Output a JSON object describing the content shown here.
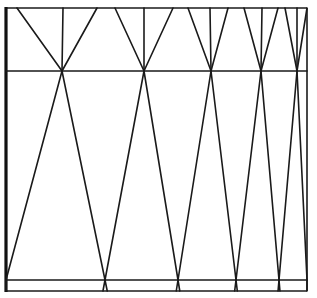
{
  "diagram": {
    "type": "geometric-line-pattern",
    "canvas": {
      "width": 317,
      "height": 298,
      "background": "#ffffff",
      "stroke": "#1a1a1a"
    },
    "frame": {
      "left": 6,
      "top": 8,
      "right": 307,
      "bottom": 291
    },
    "horizontals": [
      71,
      280
    ],
    "top_apexes": [
      {
        "x": 62,
        "y": 71,
        "top_points": [
          17,
          63,
          97
        ]
      },
      {
        "x": 144,
        "y": 71,
        "top_points": [
          115,
          144,
          173
        ]
      },
      {
        "x": 211,
        "y": 71,
        "top_points": [
          188,
          210,
          228
        ]
      },
      {
        "x": 261,
        "y": 71,
        "top_points": [
          244,
          262,
          278
        ]
      },
      {
        "x": 297,
        "y": 71,
        "top_points": [
          285,
          297,
          307
        ]
      }
    ],
    "bottom_nodes": [
      {
        "x": 6,
        "y": 280
      },
      {
        "x": 105,
        "y": 280
      },
      {
        "x": 178,
        "y": 280
      },
      {
        "x": 236,
        "y": 280
      },
      {
        "x": 279,
        "y": 280
      },
      {
        "x": 307,
        "y": 280
      }
    ]
  }
}
